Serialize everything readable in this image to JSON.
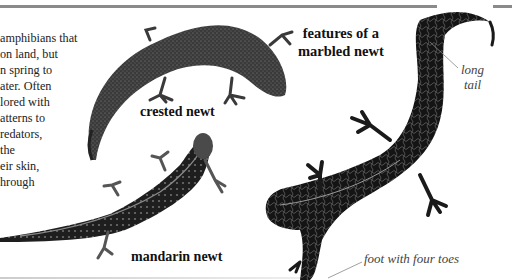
{
  "page": {
    "body_text_lines": [
      "amphibians that",
      "on land, but",
      "n spring to",
      "ater. Often",
      "lored with",
      "atterns to",
      "redators,",
      "the",
      "eir skin,",
      "hrough"
    ],
    "heading_lines": [
      "features of a",
      "marbled newt"
    ],
    "labels": {
      "crested": "crested newt",
      "mandarin": "mandarin newt"
    },
    "annotations": {
      "tail_line1": "long",
      "tail_line2": "tail",
      "foot": "foot with four toes"
    },
    "colors": {
      "rule": "#8a8a8a",
      "newt_dark": "#1c1c1c",
      "annotation_text": "#444444"
    }
  }
}
